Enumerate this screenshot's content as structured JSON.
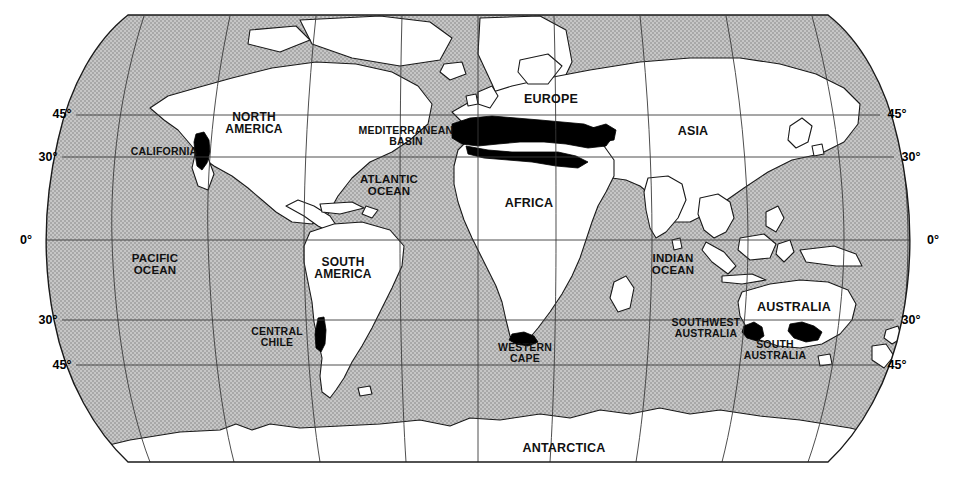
{
  "map": {
    "title": "World map of mediterranean-climate regions",
    "projection": "robinson",
    "colors": {
      "ocean": "#bcbcbc",
      "land": "#ffffff",
      "coastline": "#1a1a1a",
      "graticule": "#3a3a3a",
      "highlight": "#000000",
      "text": "#111111",
      "background": "#ffffff"
    },
    "latitude_labels_left": [
      {
        "text": "45°",
        "x": 62,
        "y": 114
      },
      {
        "text": "30°",
        "x": 48,
        "y": 157
      },
      {
        "text": "0°",
        "x": 26,
        "y": 240
      },
      {
        "text": "30°",
        "x": 48,
        "y": 320
      },
      {
        "text": "45°",
        "x": 62,
        "y": 365
      }
    ],
    "latitude_labels_right": [
      {
        "text": "45°",
        "x": 897,
        "y": 114
      },
      {
        "text": "30°",
        "x": 911,
        "y": 157
      },
      {
        "text": "0°",
        "x": 933,
        "y": 240
      },
      {
        "text": "30°",
        "x": 911,
        "y": 320
      },
      {
        "text": "45°",
        "x": 897,
        "y": 365
      }
    ],
    "continent_labels": [
      {
        "name": "north-america",
        "text": "NORTH\nAMERICA",
        "x": 254,
        "y": 123,
        "size": "sz-cont"
      },
      {
        "name": "south-america",
        "text": "SOUTH\nAMERICA",
        "x": 343,
        "y": 268,
        "size": "sz-cont"
      },
      {
        "name": "europe",
        "text": "EUROPE",
        "x": 551,
        "y": 99,
        "size": "sz-big"
      },
      {
        "name": "africa",
        "text": "AFRICA",
        "x": 529,
        "y": 203,
        "size": "sz-big"
      },
      {
        "name": "asia",
        "text": "ASIA",
        "x": 693,
        "y": 131,
        "size": "sz-big"
      },
      {
        "name": "australia",
        "text": "AUSTRALIA",
        "x": 794,
        "y": 307,
        "size": "sz-big"
      },
      {
        "name": "antarctica",
        "text": "ANTARCTICA",
        "x": 564,
        "y": 448,
        "size": "sz-big"
      }
    ],
    "ocean_labels": [
      {
        "name": "pacific-ocean",
        "text": "PACIFIC\nOCEAN",
        "x": 155,
        "y": 265,
        "size": "sz-ocean"
      },
      {
        "name": "atlantic-ocean",
        "text": "ATLANTIC\nOCEAN",
        "x": 389,
        "y": 186,
        "size": "sz-ocean"
      },
      {
        "name": "indian-ocean",
        "text": "INDIAN\nOCEAN",
        "x": 673,
        "y": 265,
        "size": "sz-ocean"
      }
    ],
    "region_labels": [
      {
        "name": "california",
        "text": "CALIFORNIA",
        "x": 164,
        "y": 151,
        "size": "sz-region"
      },
      {
        "name": "mediterranean-basin",
        "text": "MEDITERRANEAN\nBASIN",
        "x": 406,
        "y": 136,
        "size": "sz-region"
      },
      {
        "name": "central-chile",
        "text": "CENTRAL\nCHILE",
        "x": 277,
        "y": 337,
        "size": "sz-region"
      },
      {
        "name": "western-cape",
        "text": "WESTERN\nCAPE",
        "x": 525,
        "y": 353,
        "size": "sz-region"
      },
      {
        "name": "southwest-australia",
        "text": "SOUTHWEST\nAUSTRALIA",
        "x": 706,
        "y": 328,
        "size": "sz-region"
      },
      {
        "name": "south-australia",
        "text": "SOUTH\nAUSTRALIA",
        "x": 775,
        "y": 350,
        "size": "sz-region"
      }
    ],
    "highlighted_regions": [
      "California",
      "Mediterranean Basin",
      "Central Chile",
      "Western Cape",
      "Southwest Australia",
      "South Australia"
    ]
  }
}
